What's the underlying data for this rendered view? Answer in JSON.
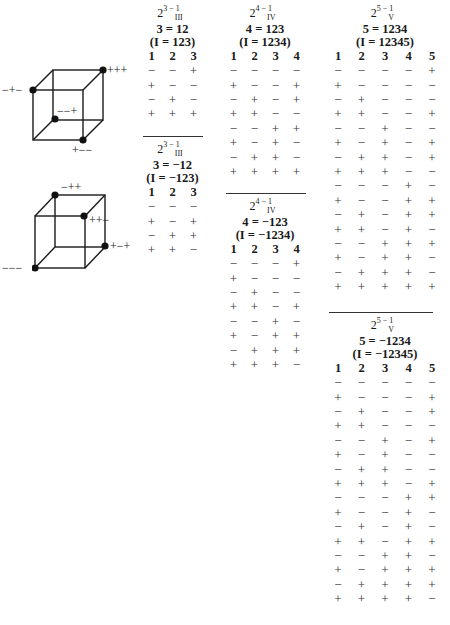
{
  "cubes": [
    {
      "labels": {
        "top_right_front": "+++",
        "top_left_back": "−+−",
        "bottom_back_inner": "−−+",
        "bottom_right_front": "+−−"
      }
    },
    {
      "labels": {
        "top_left_back": "−++",
        "top_right_front": "++−",
        "bottom_right_back": "+−+",
        "bottom_left_front": "−−−"
      }
    }
  ],
  "designs": {
    "d3a": {
      "base": "2",
      "exp": "3 − 1",
      "res": "III",
      "generator": "3 = 12",
      "relation": "(I = 123)",
      "columns": [
        "1",
        "2",
        "3"
      ],
      "rows": [
        [
          "−",
          "−",
          "+"
        ],
        [
          "+",
          "−",
          "−"
        ],
        [
          "−",
          "+",
          "−"
        ],
        [
          "+",
          "+",
          "+"
        ]
      ]
    },
    "d3b": {
      "base": "2",
      "exp": "3 − 1",
      "res": "III",
      "generator": "3 = −12",
      "relation": "(I = −123)",
      "columns": [
        "1",
        "2",
        "3"
      ],
      "rows": [
        [
          "−",
          "−",
          "−"
        ],
        [
          "+",
          "−",
          "+"
        ],
        [
          "−",
          "+",
          "+"
        ],
        [
          "+",
          "+",
          "−"
        ]
      ]
    },
    "d4a": {
      "base": "2",
      "exp": "4 − 1",
      "res": "IV",
      "generator": "4 = 123",
      "relation": "(I = 1234)",
      "columns": [
        "1",
        "2",
        "3",
        "4"
      ],
      "rows": [
        [
          "−",
          "−",
          "−",
          "−"
        ],
        [
          "+",
          "−",
          "−",
          "+"
        ],
        [
          "−",
          "+",
          "−",
          "+"
        ],
        [
          "+",
          "+",
          "−",
          "−"
        ],
        [
          "−",
          "−",
          "+",
          "+"
        ],
        [
          "+",
          "−",
          "+",
          "−"
        ],
        [
          "−",
          "+",
          "+",
          "−"
        ],
        [
          "+",
          "+",
          "+",
          "+"
        ]
      ]
    },
    "d4b": {
      "base": "2",
      "exp": "4 − 1",
      "res": "IV",
      "generator": "4 = −123",
      "relation": "(I = −1234)",
      "columns": [
        "1",
        "2",
        "3",
        "4"
      ],
      "rows": [
        [
          "−",
          "−",
          "−",
          "+"
        ],
        [
          "+",
          "−",
          "−",
          "−"
        ],
        [
          "−",
          "+",
          "−",
          "−"
        ],
        [
          "+",
          "+",
          "−",
          "+"
        ],
        [
          "−",
          "−",
          "+",
          "−"
        ],
        [
          "+",
          "−",
          "+",
          "+"
        ],
        [
          "−",
          "+",
          "+",
          "+"
        ],
        [
          "+",
          "+",
          "+",
          "−"
        ]
      ]
    },
    "d5a": {
      "base": "2",
      "exp": "5 − 1",
      "res": "V",
      "generator": "5 = 1234",
      "relation": "(I = 12345)",
      "columns": [
        "1",
        "2",
        "3",
        "4",
        "5"
      ],
      "rows": [
        [
          "−",
          "−",
          "−",
          "−",
          "+"
        ],
        [
          "+",
          "−",
          "−",
          "−",
          "−"
        ],
        [
          "−",
          "+",
          "−",
          "−",
          "−"
        ],
        [
          "+",
          "+",
          "−",
          "−",
          "+"
        ],
        [
          "−",
          "−",
          "+",
          "−",
          "−"
        ],
        [
          "+",
          "−",
          "+",
          "−",
          "+"
        ],
        [
          "−",
          "+",
          "+",
          "−",
          "+"
        ],
        [
          "+",
          "+",
          "+",
          "−",
          "−"
        ],
        [
          "−",
          "−",
          "−",
          "+",
          "−"
        ],
        [
          "+",
          "−",
          "−",
          "+",
          "+"
        ],
        [
          "−",
          "+",
          "−",
          "+",
          "+"
        ],
        [
          "+",
          "+",
          "−",
          "+",
          "−"
        ],
        [
          "−",
          "−",
          "+",
          "+",
          "+"
        ],
        [
          "+",
          "−",
          "+",
          "+",
          "−"
        ],
        [
          "−",
          "+",
          "+",
          "+",
          "−"
        ],
        [
          "+",
          "+",
          "+",
          "+",
          "+"
        ]
      ]
    },
    "d5b": {
      "base": "2",
      "exp": "5 − 1",
      "res": "V",
      "generator": "5 = −1234",
      "relation": "(I = −12345)",
      "columns": [
        "1",
        "2",
        "3",
        "4",
        "5"
      ],
      "rows": [
        [
          "−",
          "−",
          "−",
          "−",
          "−"
        ],
        [
          "+",
          "−",
          "−",
          "−",
          "+"
        ],
        [
          "−",
          "+",
          "−",
          "−",
          "+"
        ],
        [
          "+",
          "+",
          "−",
          "−",
          "−"
        ],
        [
          "−",
          "−",
          "+",
          "−",
          "+"
        ],
        [
          "+",
          "−",
          "+",
          "−",
          "−"
        ],
        [
          "−",
          "+",
          "+",
          "−",
          "−"
        ],
        [
          "+",
          "+",
          "+",
          "−",
          "+"
        ],
        [
          "−",
          "−",
          "−",
          "+",
          "+"
        ],
        [
          "+",
          "−",
          "−",
          "+",
          "−"
        ],
        [
          "−",
          "+",
          "−",
          "+",
          "−"
        ],
        [
          "+",
          "+",
          "−",
          "+",
          "+"
        ],
        [
          "−",
          "−",
          "+",
          "+",
          "−"
        ],
        [
          "+",
          "−",
          "+",
          "+",
          "+"
        ],
        [
          "−",
          "+",
          "+",
          "+",
          "+"
        ],
        [
          "+",
          "+",
          "+",
          "+",
          "−"
        ]
      ]
    }
  }
}
